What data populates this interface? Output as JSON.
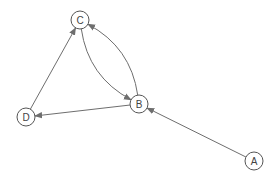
{
  "diagram": {
    "type": "directed-graph",
    "colors": {
      "edge": "#6e6e6e",
      "node_stroke": "#555555",
      "node_fill": "#ffffff",
      "label": "#444444"
    },
    "nodes": [
      {
        "id": "A",
        "label": "A",
        "x": 254,
        "y": 161
      },
      {
        "id": "B",
        "label": "B",
        "x": 139,
        "y": 104
      },
      {
        "id": "C",
        "label": "C",
        "x": 80,
        "y": 20
      },
      {
        "id": "D",
        "label": "D",
        "x": 26,
        "y": 117
      }
    ],
    "edges": [
      {
        "from": "A",
        "to": "B",
        "curved": false
      },
      {
        "from": "B",
        "to": "D",
        "curved": false
      },
      {
        "from": "D",
        "to": "C",
        "curved": false
      },
      {
        "from": "C",
        "to": "B",
        "curved": true,
        "side": "left"
      },
      {
        "from": "B",
        "to": "C",
        "curved": true,
        "side": "right"
      }
    ]
  }
}
